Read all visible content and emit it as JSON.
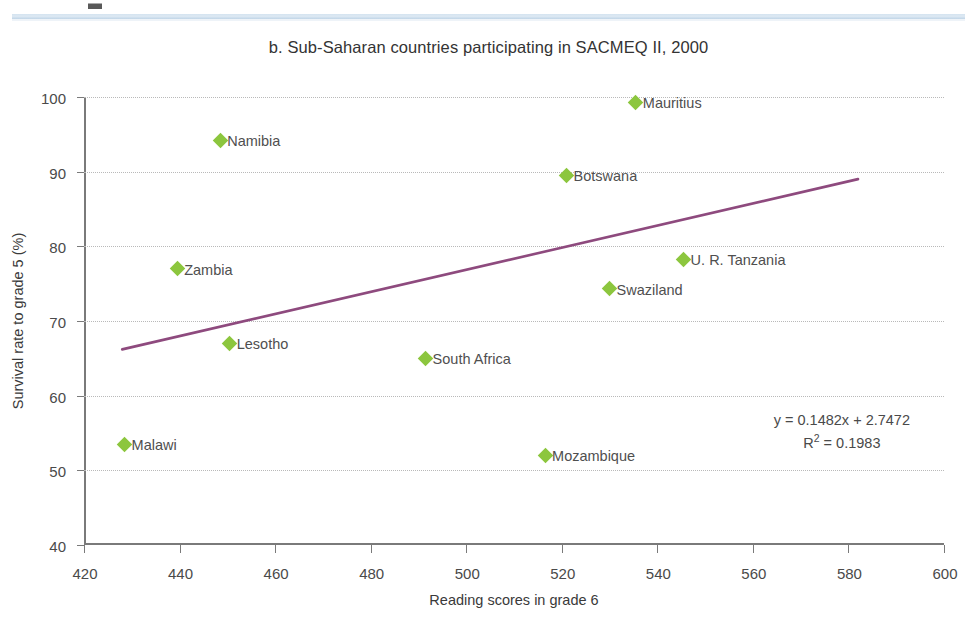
{
  "page": {
    "top_fragment": ""
  },
  "chart_data": {
    "type": "scatter",
    "title": "b. Sub-Saharan countries participating in SACMEQ II, 2000",
    "xlabel": "Reading scores in grade 6",
    "ylabel": "Survival rate to grade 5 (%)",
    "xlim": [
      420,
      600
    ],
    "ylim": [
      40,
      100
    ],
    "xticks": [
      420,
      440,
      460,
      480,
      500,
      520,
      540,
      560,
      580,
      600
    ],
    "yticks": [
      40,
      50,
      60,
      70,
      80,
      90,
      100
    ],
    "grid": "horizontal-dotted",
    "legend": "none",
    "marker_color": "#8cc63e",
    "marker_shape": "diamond",
    "trendline": {
      "color": "#8e4a7e",
      "x_start": 428,
      "y_start": 66.2,
      "x_end": 582,
      "y_end": 89.0,
      "equation": "y = 0.1482x + 2.7472",
      "r_squared_label": "R",
      "r_squared_sup": "2",
      "r_squared_value": " = 0.1983"
    },
    "points": [
      {
        "label": "Malawi",
        "x": 428.5,
        "y": 53.5,
        "label_side": "right"
      },
      {
        "label": "Zambia",
        "x": 439.5,
        "y": 77.0,
        "label_side": "right"
      },
      {
        "label": "Namibia",
        "x": 448.5,
        "y": 94.2,
        "label_side": "right"
      },
      {
        "label": "Lesotho",
        "x": 450.5,
        "y": 67.0,
        "label_side": "right"
      },
      {
        "label": "South Africa",
        "x": 491.5,
        "y": 65.0,
        "label_side": "right"
      },
      {
        "label": "Mozambique",
        "x": 516.5,
        "y": 52.0,
        "label_side": "right"
      },
      {
        "label": "Botswana",
        "x": 521.0,
        "y": 89.5,
        "label_side": "right"
      },
      {
        "label": "Swaziland",
        "x": 530.0,
        "y": 74.3,
        "label_side": "right"
      },
      {
        "label": "Mauritius",
        "x": 535.5,
        "y": 99.3,
        "label_side": "right"
      },
      {
        "label": "U. R. Tanzania",
        "x": 545.5,
        "y": 78.3,
        "label_side": "right"
      }
    ]
  }
}
